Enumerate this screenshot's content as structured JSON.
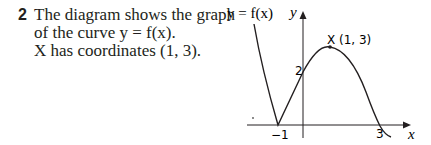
{
  "question": {
    "number": "2",
    "lines": [
      "The diagram shows the graph",
      "of the curve  y = f(x).",
      "X has coordinates (1, 3)."
    ]
  },
  "diagram": {
    "curve_label": "y = f(x)",
    "y_axis_label": "y",
    "x_axis_label": "x",
    "point_label": "X (1, 3)",
    "y_intercept_label": "2",
    "x_tick_neg1": "−1",
    "x_tick_3": "3"
  }
}
